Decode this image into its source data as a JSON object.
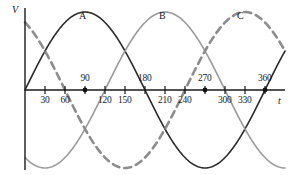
{
  "figure": {
    "width": 291,
    "height": 175,
    "background": "#ffffff"
  },
  "axes": {
    "y_axis_label": "V",
    "x_axis_label": "t",
    "axis_color": "#1a1a1a",
    "origin_x": 25,
    "origin_y": 90,
    "x_axis_end": 285,
    "y_axis_top": 8,
    "y_axis_bottom": 170,
    "degrees_per_pixel": 1.5,
    "pixels_per_period": 240,
    "amplitude_px": 78
  },
  "ticks_below": [
    {
      "label": "30",
      "degrees": 30
    },
    {
      "label": "60",
      "degrees": 60
    },
    {
      "label": "120",
      "degrees": 120
    },
    {
      "label": "150",
      "degrees": 150
    },
    {
      "label": "210",
      "degrees": 210
    },
    {
      "label": "240",
      "degrees": 240
    },
    {
      "label": "300",
      "degrees": 300
    },
    {
      "label": "330",
      "degrees": 330
    }
  ],
  "ticks_above": [
    {
      "label": "90",
      "degrees": 90
    },
    {
      "label": "180",
      "degrees": 180
    },
    {
      "label": "270",
      "degrees": 270
    },
    {
      "label": "360",
      "degrees": 360
    }
  ],
  "axis_dots": [
    {
      "degrees": 90
    },
    {
      "degrees": 270
    },
    {
      "degrees": 360
    }
  ],
  "curve_labels": [
    {
      "name": "A",
      "x": 79,
      "y": 10
    },
    {
      "name": "B",
      "x": 159,
      "y": 10
    },
    {
      "name": "C",
      "x": 237,
      "y": 10
    }
  ],
  "chart_data": {
    "type": "line",
    "title": "",
    "xlabel": "t",
    "ylabel": "V",
    "xlim": [
      0,
      390
    ],
    "ylim": [
      -1.15,
      1.15
    ],
    "grid": false,
    "legend": "inline-curve-labels",
    "x_tick_labels": [
      "30",
      "60",
      "90",
      "120",
      "150",
      "180",
      "210",
      "240",
      "270",
      "300",
      "330",
      "360"
    ],
    "x_tick_degrees": [
      30,
      60,
      90,
      120,
      150,
      180,
      210,
      240,
      270,
      300,
      330,
      360
    ],
    "series": [
      {
        "name": "A",
        "phase_degrees": 0,
        "amplitude": 1,
        "period_degrees": 360,
        "color": "#2b2b2b",
        "linestyle": "solid",
        "linewidth": 1.6,
        "zero_crossings_rising": [
          0,
          360
        ],
        "peak_degrees": [
          90
        ],
        "trough_degrees": [
          270
        ],
        "values_at_ticks": [
          0.5,
          0.87,
          1.0,
          0.87,
          0.5,
          0.0,
          -0.5,
          -0.87,
          -1.0,
          -0.87,
          -0.5,
          0.0
        ]
      },
      {
        "name": "B",
        "phase_degrees": -120,
        "amplitude": 1,
        "period_degrees": 360,
        "color": "#9a9a9a",
        "linestyle": "solid",
        "linewidth": 1.6,
        "zero_crossings_rising": [
          120
        ],
        "peak_degrees": [
          210
        ],
        "trough_degrees": [
          30,
          390
        ],
        "values_at_ticks": [
          -1.0,
          -0.87,
          -0.5,
          0.0,
          0.5,
          0.87,
          1.0,
          0.87,
          0.5,
          0.0,
          -0.5,
          -0.87
        ]
      },
      {
        "name": "C",
        "phase_degrees": 120,
        "amplitude": 1,
        "period_degrees": 360,
        "color": "#8c8c8c",
        "linestyle": "dashed",
        "linewidth": 2.6,
        "dash_pattern": "7,5",
        "zero_crossings_falling": [
          60
        ],
        "peak_degrees": [
          330
        ],
        "trough_degrees": [
          150
        ],
        "values_at_ticks": [
          0.5,
          0.0,
          -0.5,
          -0.87,
          -1.0,
          -0.87,
          -0.5,
          0.0,
          0.5,
          0.87,
          1.0,
          0.87
        ]
      }
    ]
  }
}
